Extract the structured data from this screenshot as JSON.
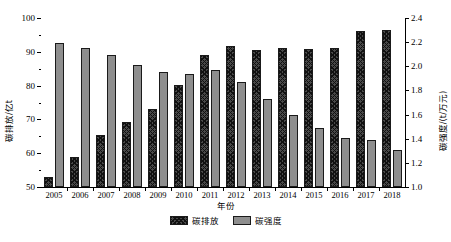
{
  "chart_data": {
    "type": "bar",
    "title": "",
    "xlabel": "年份",
    "ylabel": "碳排放/亿t",
    "y2label": "碳强度/(t/万元)",
    "categories": [
      "2005",
      "2006",
      "2007",
      "2008",
      "2009",
      "2010",
      "2011",
      "2012",
      "2013",
      "2014",
      "2015",
      "2016",
      "2017",
      "2018"
    ],
    "ylim": [
      50,
      100
    ],
    "y2lim": [
      1.0,
      2.4
    ],
    "yticks": [
      50,
      60,
      70,
      80,
      90,
      100
    ],
    "ytick_labels": [
      "50",
      "60",
      "70",
      "80",
      "90",
      "100"
    ],
    "y2ticks": [
      1.0,
      1.2,
      1.4,
      1.6,
      1.8,
      2.0,
      2.2,
      2.4
    ],
    "y2tick_labels": [
      "1.0",
      "1.2",
      "1.4",
      "1.6",
      "1.8",
      "2.0",
      "2.2",
      "2.4"
    ],
    "grid": false,
    "legend_position": "bottom",
    "series": [
      {
        "name": "碳排放",
        "axis": "left",
        "style": "crosshatch",
        "color": "#4a4a4a",
        "values": [
          53.0,
          59.0,
          65.5,
          69.3,
          73.0,
          80.3,
          89.0,
          91.8,
          90.5,
          91.0,
          90.8,
          91.0,
          96.3,
          96.5
        ]
      },
      {
        "name": "碳强度",
        "axis": "right",
        "style": "solid",
        "color": "#8e8e8e",
        "values": [
          2.19,
          2.15,
          2.09,
          2.01,
          1.95,
          1.94,
          1.97,
          1.87,
          1.73,
          1.6,
          1.49,
          1.41,
          1.39,
          1.31
        ]
      }
    ]
  },
  "legend": {
    "items": [
      {
        "label": "碳排放"
      },
      {
        "label": "碳强度"
      }
    ]
  }
}
